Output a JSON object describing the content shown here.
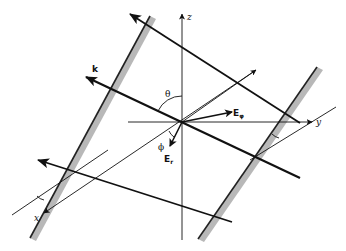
{
  "diagram": {
    "labels": {
      "z_axis": "z",
      "y_axis": "y",
      "x_axis": "x",
      "wave_vector": "k",
      "polar_angle": "θ",
      "azimuth_angle": "ϕ",
      "e_parallel": "E",
      "e_parallel_sub": "φ",
      "e_perp": "E",
      "e_perp_sub": "r"
    },
    "colors": {
      "line": "#111111",
      "plate_fill": "#b8b8b8",
      "plate_edge": "#222222",
      "background": "#ffffff"
    },
    "origin": [
      182,
      122
    ]
  }
}
